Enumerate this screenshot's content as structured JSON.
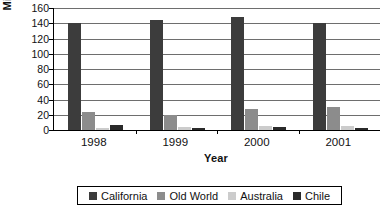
{
  "chart_data": {
    "type": "bar",
    "title": "",
    "xlabel": "Year",
    "ylabel": "Million Cases",
    "categories": [
      "1998",
      "1999",
      "2000",
      "2001"
    ],
    "yticks": [
      0,
      20,
      40,
      60,
      80,
      100,
      120,
      140,
      160
    ],
    "ylim": [
      0,
      160
    ],
    "grid": true,
    "legend_position": "bottom",
    "series": [
      {
        "name": "California",
        "color": "#3c3c3c",
        "values": [
          141,
          144,
          148,
          141
        ]
      },
      {
        "name": "Old World",
        "color": "#8c8c8c",
        "values": [
          23,
          20,
          28,
          30
        ]
      },
      {
        "name": "Australia",
        "color": "#cccccc",
        "values": [
          3,
          4,
          5,
          5
        ]
      },
      {
        "name": "Chile",
        "color": "#2a2a2a",
        "values": [
          7,
          2,
          4,
          2
        ]
      }
    ]
  },
  "axis": {
    "y_title": "Million Cases",
    "x_title": "Year",
    "y_tick_labels": [
      "160",
      "140",
      "120",
      "100",
      "80",
      "60",
      "40",
      "20",
      "0"
    ],
    "x_tick_labels": [
      "1998",
      "1999",
      "2000",
      "2001"
    ]
  },
  "legend": {
    "items": [
      {
        "label": "California",
        "color": "#3c3c3c"
      },
      {
        "label": "Old World",
        "color": "#8c8c8c"
      },
      {
        "label": "Australia",
        "color": "#cccccc"
      },
      {
        "label": "Chile",
        "color": "#2a2a2a"
      }
    ]
  }
}
